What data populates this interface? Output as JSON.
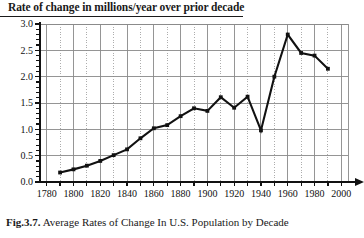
{
  "figure": {
    "title": "Rate of change in millions/year over prior decade",
    "caption_number": "Fig.3.7.",
    "caption_text": "Average Rates of Change In U.S. Population by Decade"
  },
  "chart_data": {
    "type": "line",
    "title": "Rate of change in millions/year over prior decade",
    "xlabel": "year",
    "ylabel": "",
    "xlim": [
      1775,
      2005
    ],
    "ylim": [
      0.0,
      3.0
    ],
    "grid": true,
    "legend": "none",
    "xticks": [
      1780,
      1800,
      1820,
      1840,
      1860,
      1880,
      1900,
      1920,
      1940,
      1960,
      1980,
      2000
    ],
    "xtick_labels": [
      "1780",
      "1800",
      "1820",
      "1840",
      "1860",
      "1880",
      "1900",
      "1920",
      "1940",
      "1960",
      "1980",
      "2000"
    ],
    "yticks": [
      0.0,
      0.5,
      1.0,
      1.5,
      2.0,
      2.5,
      3.0
    ],
    "ytick_labels": [
      "0.0",
      "0.5",
      "1.0",
      "1.5",
      "2.0",
      "2.5",
      "3.0"
    ],
    "x": [
      1790,
      1800,
      1810,
      1820,
      1830,
      1840,
      1850,
      1860,
      1870,
      1880,
      1890,
      1900,
      1910,
      1920,
      1930,
      1940,
      1950,
      1960,
      1970,
      1980,
      1990
    ],
    "values": [
      0.18,
      0.24,
      0.31,
      0.4,
      0.51,
      0.62,
      0.83,
      1.02,
      1.08,
      1.25,
      1.4,
      1.35,
      1.61,
      1.41,
      1.62,
      0.98,
      2.0,
      2.8,
      2.45,
      2.4,
      2.15
    ],
    "series": [
      {
        "name": "Average rate of change in U.S. population",
        "values": [
          0.18,
          0.24,
          0.31,
          0.4,
          0.51,
          0.62,
          0.83,
          1.02,
          1.08,
          1.25,
          1.4,
          1.35,
          1.61,
          1.41,
          1.62,
          0.98,
          2.0,
          2.8,
          2.45,
          2.4,
          2.15
        ]
      }
    ],
    "markers": "square",
    "line_color": "#111111",
    "grid_color": "#8a8a8a",
    "axis_color": "#111111",
    "annotations": [
      "year"
    ]
  }
}
